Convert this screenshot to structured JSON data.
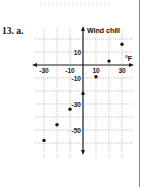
{
  "problem": {
    "label": "13. a."
  },
  "chart_data": {
    "type": "scatter",
    "title": "",
    "xlabel": "°F",
    "ylabel": "Wind chill",
    "x_tick_labels": [
      "-30",
      "-10",
      "10",
      "30"
    ],
    "y_tick_labels": [
      "10",
      "-10",
      "-30",
      "-50"
    ],
    "xlim": [
      -35,
      38
    ],
    "ylim": [
      -70,
      30
    ],
    "grid": true,
    "grid_step": 10,
    "legend": "none",
    "series": [
      {
        "name": "Wind chill",
        "x": [
          -30,
          -20,
          -10,
          0,
          10,
          20,
          30
        ],
        "y": [
          -58,
          -46,
          -34,
          -22,
          -9,
          3,
          16
        ]
      }
    ]
  },
  "colors": {
    "axis": "#1a1a1a",
    "grid": "#a0a0a0",
    "point": "#111111"
  }
}
